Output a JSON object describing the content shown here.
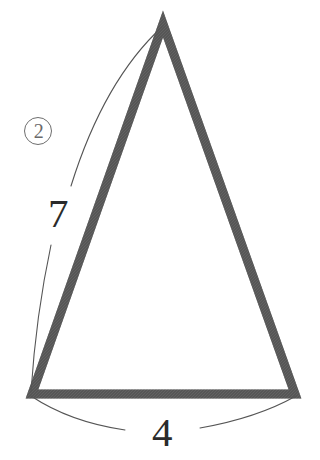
{
  "figure": {
    "type": "geometry-diagram",
    "shape": "isosceles-triangle",
    "background_color": "#ffffff",
    "stroke_color": "#555555",
    "arc_color": "#555555",
    "text_color": "#2b2b2b",
    "problem_number": {
      "label": "2",
      "display": "circled",
      "color": "#6a6a6a"
    },
    "vertices": {
      "apex": {
        "x": 163,
        "y": 24
      },
      "bottom_left": {
        "x": 32,
        "y": 394
      },
      "bottom_right": {
        "x": 295,
        "y": 394
      }
    },
    "dimension_labels": [
      {
        "name": "left-side-length",
        "value": "7",
        "measures": "left-slanted-side",
        "arc_side": "outside-left"
      },
      {
        "name": "base-length",
        "value": "4",
        "measures": "bottom-base",
        "arc_side": "outside-below"
      }
    ]
  }
}
